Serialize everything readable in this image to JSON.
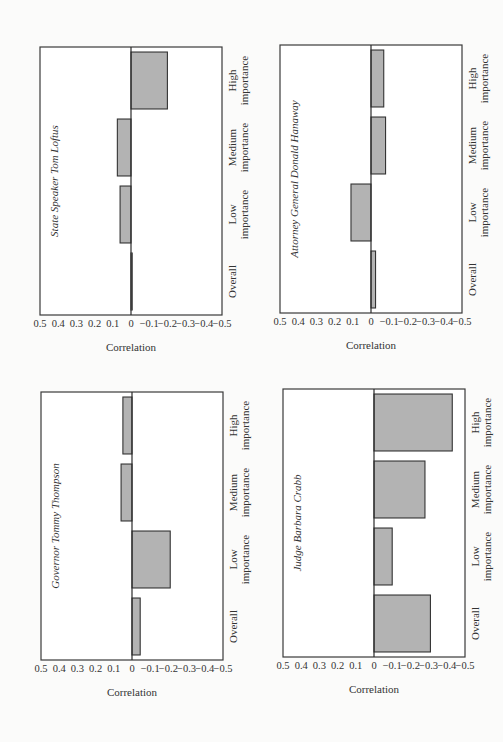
{
  "page": {
    "orientation": "rotated-90-ccw",
    "panel_count": 4
  },
  "colors": {
    "bar_fill": "#b3b3b3",
    "bar_stroke": "#333333",
    "frame": "#3a3a3a",
    "background": "#ffffff"
  },
  "chart_data": [
    {
      "type": "bar",
      "title": "State Speaker Tom Loftus",
      "categories": [
        "Overall",
        "Low importance",
        "Medium importance",
        "High importance"
      ],
      "values": [
        -0.005,
        0.06,
        0.075,
        -0.2
      ],
      "xlabel": "",
      "ylabel": "Correlation",
      "ylim": [
        -0.5,
        0.5
      ],
      "yticks": [
        "0.5",
        "0.4",
        "0.3",
        "0.2",
        "0.1",
        "0",
        "−0.1",
        "−0.2",
        "−0.3",
        "−0.4",
        "−0.5"
      ],
      "grid": false,
      "legend": null
    },
    {
      "type": "bar",
      "title": "Attorney General Donald Hanaway",
      "categories": [
        "Overall",
        "Low importance",
        "Medium importance",
        "High importance"
      ],
      "values": [
        -0.025,
        0.11,
        -0.08,
        -0.07
      ],
      "xlabel": "",
      "ylabel": "Correlation",
      "ylim": [
        -0.5,
        0.5
      ],
      "yticks": [
        "0.5",
        "0.4",
        "0.3",
        "0.2",
        "0.1",
        "0",
        "−0.1",
        "−0.2",
        "−0.3",
        "−0.4",
        "−0.5"
      ],
      "grid": false,
      "legend": null
    },
    {
      "type": "bar",
      "title": "Governor Tommy Thompson",
      "categories": [
        "Overall",
        "Low importance",
        "Medium importance",
        "High importance"
      ],
      "values": [
        -0.045,
        -0.21,
        0.06,
        0.05
      ],
      "xlabel": "",
      "ylabel": "Correlation",
      "ylim": [
        -0.5,
        0.5
      ],
      "yticks": [
        "0.5",
        "0.4",
        "0.3",
        "0.2",
        "0.1",
        "0",
        "−0.1",
        "−0.2",
        "−0.3",
        "−0.4",
        "−0.5"
      ],
      "grid": false,
      "legend": null
    },
    {
      "type": "bar",
      "title": "Judge Barbara Crabb",
      "categories": [
        "Overall",
        "Low importance",
        "Medium importance",
        "High importance"
      ],
      "values": [
        -0.31,
        -0.1,
        -0.28,
        -0.43
      ],
      "xlabel": "",
      "ylabel": "Correlation",
      "ylim": [
        -0.5,
        0.5
      ],
      "yticks": [
        "0.5",
        "0.4",
        "0.3",
        "0.2",
        "0.1",
        "0",
        "−0.1",
        "−0.2",
        "−0.3",
        "−0.4",
        "−0.5"
      ],
      "grid": false,
      "legend": null
    }
  ],
  "panels": [
    {
      "title": "State Speaker Tom Loftus",
      "ylabel": "Correlation",
      "cat": [
        [
          "Overall",
          ""
        ],
        [
          "Low",
          "importance"
        ],
        [
          "Medium",
          "importance"
        ],
        [
          "High",
          "importance"
        ]
      ]
    },
    {
      "title": "Attorney General Donald Hanaway",
      "ylabel": "Correlation",
      "cat": [
        [
          "Overall",
          ""
        ],
        [
          "Low",
          "importance"
        ],
        [
          "Medium",
          "importance"
        ],
        [
          "High",
          "importance"
        ]
      ]
    },
    {
      "title": "Governor Tommy Thompson",
      "ylabel": "Correlation",
      "cat": [
        [
          "Overall",
          ""
        ],
        [
          "Low",
          "importance"
        ],
        [
          "Medium",
          "importance"
        ],
        [
          "High",
          "importance"
        ]
      ]
    },
    {
      "title": "Judge Barbara Crabb",
      "ylabel": "Correlation",
      "cat": [
        [
          "Overall",
          ""
        ],
        [
          "Low",
          "importance"
        ],
        [
          "Medium",
          "importance"
        ],
        [
          "High",
          "importance"
        ]
      ]
    }
  ]
}
